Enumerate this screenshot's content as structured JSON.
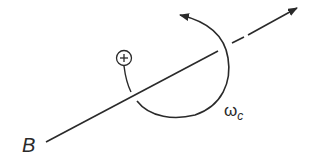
{
  "diagram": {
    "labels": {
      "field": "B",
      "omega": "ω",
      "omega_sub": "c",
      "charge": "+"
    },
    "colors": {
      "stroke": "#2a2a2a",
      "background": "#ffffff"
    }
  }
}
